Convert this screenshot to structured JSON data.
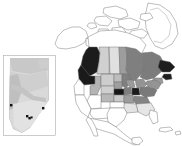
{
  "figure": {
    "background_color": "#ffffff",
    "width": 182,
    "height": 146,
    "outline_color": "#6e6e6e",
    "point_color": "#111111"
  },
  "legend_scale": {
    "description": "grayscale choropleth shading, darker = higher value",
    "swatches": [
      {
        "label": "none",
        "color": "#ffffff"
      },
      {
        "label": "very low",
        "color": "#e2e2e2"
      },
      {
        "label": "low",
        "color": "#cfcfcf"
      },
      {
        "label": "medium-low",
        "color": "#b6b6b6"
      },
      {
        "label": "medium",
        "color": "#9a9a9a"
      },
      {
        "label": "medium-high",
        "color": "#7d7d7d"
      },
      {
        "label": "high",
        "color": "#5a5a5a"
      },
      {
        "label": "very high",
        "color": "#1a1a1a"
      }
    ]
  },
  "main_map": {
    "name": "north-america-choropleth",
    "unfilled_areas": [
      "Alaska",
      "Greenland",
      "Arctic Archipelago",
      "Mexico",
      "Yukon",
      "Northwest Territories (north)",
      "Nunavut"
    ],
    "regions": [
      {
        "id": "british-columbia",
        "label": "British Columbia",
        "shade": "very high",
        "color": "#1c1c1c"
      },
      {
        "id": "alberta",
        "label": "Alberta",
        "shade": "low",
        "color": "#d0d0d0"
      },
      {
        "id": "saskatchewan",
        "label": "Saskatchewan",
        "shade": "very low",
        "color": "#e0e0e0"
      },
      {
        "id": "manitoba",
        "label": "Manitoba",
        "shade": "medium",
        "color": "#9d9d9d"
      },
      {
        "id": "ontario",
        "label": "Ontario",
        "shade": "medium-high",
        "color": "#7f7f7f"
      },
      {
        "id": "quebec",
        "label": "Quebec",
        "shade": "medium-high",
        "color": "#7c7c7c"
      },
      {
        "id": "labrador",
        "label": "Newfoundland and Labrador",
        "shade": "very high",
        "color": "#1e1e1e"
      },
      {
        "id": "maritimes",
        "label": "Maritime provinces",
        "shade": "medium",
        "color": "#9a9a9a"
      },
      {
        "id": "washington",
        "label": "Washington",
        "shade": "very high",
        "color": "#1a1a1a"
      },
      {
        "id": "oregon",
        "label": "Oregon",
        "shade": "none",
        "color": "#ffffff"
      },
      {
        "id": "idaho",
        "label": "Idaho",
        "shade": "medium-low",
        "color": "#b4b4b4"
      },
      {
        "id": "montana",
        "label": "Montana",
        "shade": "low",
        "color": "#cdcdcd"
      },
      {
        "id": "wyoming",
        "label": "Wyoming",
        "shade": "low",
        "color": "#cfcfcf"
      },
      {
        "id": "north-dakota",
        "label": "North Dakota",
        "shade": "medium-low",
        "color": "#bdbdbd"
      },
      {
        "id": "south-dakota",
        "label": "South Dakota",
        "shade": "medium",
        "color": "#9e9e9e"
      },
      {
        "id": "nebraska",
        "label": "Nebraska",
        "shade": "very high",
        "color": "#161616"
      },
      {
        "id": "iowa",
        "label": "Iowa",
        "shade": "medium-high",
        "color": "#7e7e7e"
      },
      {
        "id": "minnesota",
        "label": "Minnesota",
        "shade": "medium-high",
        "color": "#808080"
      },
      {
        "id": "wisconsin",
        "label": "Wisconsin",
        "shade": "medium",
        "color": "#9b9b9b"
      },
      {
        "id": "illinois",
        "label": "Illinois",
        "shade": "very high",
        "color": "#1a1a1a"
      },
      {
        "id": "colorado",
        "label": "Colorado",
        "shade": "medium-low",
        "color": "#b8b8b8"
      },
      {
        "id": "kansas",
        "label": "Kansas",
        "shade": "low",
        "color": "#cacaca"
      },
      {
        "id": "missouri",
        "label": "Missouri",
        "shade": "medium",
        "color": "#9c9c9c"
      },
      {
        "id": "oklahoma",
        "label": "Oklahoma",
        "shade": "none",
        "color": "#fdfdfd"
      },
      {
        "id": "texas",
        "label": "Texas",
        "shade": "none",
        "color": "#ffffff"
      },
      {
        "id": "utah-nevada",
        "label": "Utah and Nevada",
        "shade": "none",
        "color": "#ffffff"
      },
      {
        "id": "california",
        "label": "California",
        "shade": "none",
        "color": "#ffffff"
      },
      {
        "id": "arizona-newmexico",
        "label": "Arizona and New Mexico",
        "shade": "none",
        "color": "#ffffff"
      },
      {
        "id": "arkansas-louisiana",
        "label": "Arkansas and Louisiana",
        "shade": "very low",
        "color": "#e3e3e3"
      },
      {
        "id": "kentucky-tennessee",
        "label": "Kentucky and Tennessee",
        "shade": "medium-high",
        "color": "#848484"
      },
      {
        "id": "great-lakes-states",
        "label": "Michigan and Indiana",
        "shade": "medium",
        "color": "#959595"
      },
      {
        "id": "appalachia",
        "label": "Ohio, West Virginia, Virginia",
        "shade": "medium-high",
        "color": "#7a7a7a"
      },
      {
        "id": "northeast",
        "label": "Northeastern states",
        "shade": "medium",
        "color": "#949494"
      },
      {
        "id": "southeast",
        "label": "Southeastern states",
        "shade": "very low",
        "color": "#e6e6e6"
      },
      {
        "id": "florida",
        "label": "Florida",
        "shade": "none",
        "color": "#fefefe"
      }
    ]
  },
  "inset_map": {
    "name": "alberta-inset",
    "label": "Alberta",
    "frame_color": "#9a9a9a",
    "base_color": "#d9d9d9",
    "shade_bands": [
      {
        "id": "north-shade",
        "color": "#c3c3c3"
      },
      {
        "id": "central-shade",
        "color": "#cccccc"
      },
      {
        "id": "foothills-shade",
        "color": "#bdbdbd"
      },
      {
        "id": "south-shade",
        "color": "#e4e4e4"
      }
    ],
    "sample_points": [
      {
        "id": "site-1",
        "x": 11,
        "y": 105
      },
      {
        "id": "site-2",
        "x": 27,
        "y": 116
      },
      {
        "id": "site-3",
        "x": 29,
        "y": 118
      },
      {
        "id": "site-4",
        "x": 31,
        "y": 117
      },
      {
        "id": "site-5",
        "x": 43,
        "y": 108
      }
    ]
  }
}
